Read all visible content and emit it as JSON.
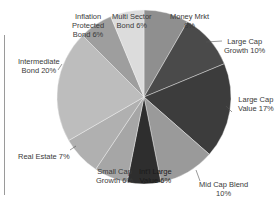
{
  "chart_data": {
    "type": "pie",
    "title": "",
    "center": [
      144,
      97
    ],
    "radius": 87,
    "start_angle_deg": -90,
    "direction": "clockwise",
    "slices": [
      {
        "name": "Money Mrkt",
        "value": 8,
        "label_lines": [
          "Money Mrkt",
          "8%"
        ],
        "color": "#8f8f8f",
        "label_pos": [
          170,
          12
        ]
      },
      {
        "name": "Large Cap Growth",
        "value": 10,
        "label_lines": [
          "Large Cap",
          "Growth 10%"
        ],
        "color": "#4a4a4a",
        "label_pos": [
          224,
          37
        ]
      },
      {
        "name": "Large Cap Value",
        "value": 17,
        "label_lines": [
          "Large Cap",
          "Value 17%"
        ],
        "color": "#3c3c3c",
        "label_pos": [
          238,
          95
        ]
      },
      {
        "name": "Mid Cap Blend",
        "value": 10,
        "label_lines": [
          "Mid Cap Blend",
          "10%"
        ],
        "color": "#9a9a9a",
        "label_pos": [
          199,
          180
        ]
      },
      {
        "name": "Intl Large Value",
        "value": 6,
        "label_lines": [
          "Int'l Large",
          "Value 6%"
        ],
        "color": "#2e2e2e",
        "label_pos": [
          139,
          167
        ]
      },
      {
        "name": "Small Cap Growth",
        "value": 6,
        "label_lines": [
          "Small Cap",
          "Growth 6%"
        ],
        "color": "#a6a6a6",
        "label_pos": [
          96,
          167
        ]
      },
      {
        "name": "Real Estate",
        "value": 7,
        "label_lines": [
          "Real Estate 7%"
        ],
        "color": "#b0b0b0",
        "label_pos": [
          18,
          152
        ]
      },
      {
        "name": "Intermediate Bond",
        "value": 20,
        "label_lines": [
          "Intermediate",
          "Bond 20%"
        ],
        "color": "#bdbdbd",
        "label_pos": [
          18,
          57
        ]
      },
      {
        "name": "Inflation Protected Bond",
        "value": 6,
        "label_lines": [
          "Inflation",
          "Protected",
          "Bond  6%"
        ],
        "color": "#9e9e9e",
        "label_pos": [
          72,
          12
        ]
      },
      {
        "name": "Multi Sector Bond",
        "value": 6,
        "label_lines": [
          "Multi Sector",
          "Bond 6%"
        ],
        "color": "#dcdcdc",
        "label_pos": [
          112,
          12
        ]
      }
    ],
    "categories": [
      "Money Mrkt",
      "Large Cap Growth",
      "Large Cap Value",
      "Mid Cap Blend",
      "Intl Large Value",
      "Small Cap Growth",
      "Real Estate",
      "Intermediate Bond",
      "Inflation Protected Bond",
      "Multi Sector Bond"
    ],
    "values": [
      8,
      10,
      17,
      10,
      6,
      6,
      7,
      20,
      6,
      6
    ],
    "unit": "%",
    "legend": "none (labels beside slices)",
    "leader_lines": [
      {
        "from": [
          206,
          42
        ],
        "to": [
          222,
          41
        ]
      },
      {
        "from": [
          226,
          106
        ],
        "to": [
          232,
          112
        ]
      },
      {
        "from": [
          196,
          170
        ],
        "to": [
          200,
          181
        ]
      },
      {
        "from": [
          70,
          150
        ],
        "to": [
          76,
          146
        ]
      },
      {
        "from": [
          62,
          64
        ],
        "to": [
          58,
          70
        ]
      }
    ]
  }
}
